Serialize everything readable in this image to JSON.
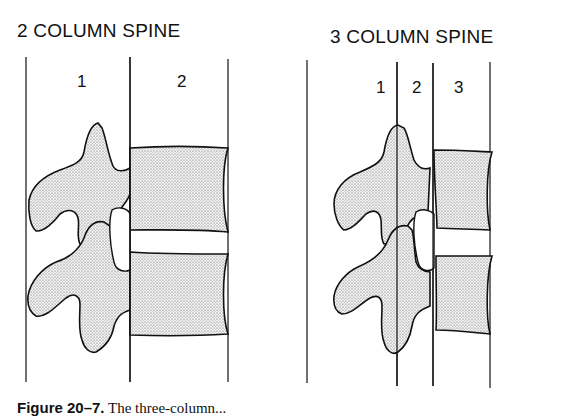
{
  "left": {
    "title": "2 COLUMN SPINE",
    "columns": [
      "1",
      "2"
    ]
  },
  "right": {
    "title": "3 COLUMN SPINE",
    "columns": [
      "1",
      "2",
      "3"
    ]
  },
  "caption": {
    "label": "Figure 20–7.",
    "text": "The three-column..."
  },
  "colors": {
    "ink": "#111111",
    "stipple": "#cfcfcf",
    "background": "#ffffff"
  }
}
